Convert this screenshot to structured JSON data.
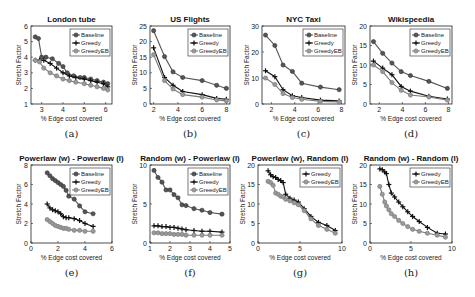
{
  "chart_data": [
    {
      "id": "a",
      "caption": "(a)",
      "type": "line",
      "title": "London tube",
      "xlabel": "% Edge cost covered",
      "ylabel": "Stretch Factor",
      "xlim": [
        2.5,
        6.3
      ],
      "ylim": [
        1,
        6
      ],
      "xticks": [
        3,
        4,
        5,
        6
      ],
      "yticks": [
        1,
        2,
        3,
        4,
        5,
        6
      ],
      "legend_position": "upper right",
      "series": [
        {
          "name": "Baseline",
          "marker": "circle",
          "x": [
            2.7,
            2.85,
            3.0,
            3.2,
            3.5,
            3.8,
            4.0,
            4.2,
            4.5,
            4.8,
            5.0,
            5.3,
            5.6,
            5.9,
            6.1
          ],
          "y": [
            5.3,
            5.2,
            4.0,
            4.0,
            3.9,
            3.6,
            3.4,
            3.0,
            2.8,
            2.7,
            2.7,
            2.6,
            2.5,
            2.4,
            2.3
          ]
        },
        {
          "name": "Greedy",
          "marker": "plus",
          "x": [
            2.7,
            2.9,
            3.1,
            3.4,
            3.7,
            4.0,
            4.3,
            4.6,
            5.0,
            5.3,
            5.6,
            5.9,
            6.1
          ],
          "y": [
            3.8,
            3.8,
            3.8,
            3.6,
            3.3,
            3.0,
            2.8,
            2.7,
            2.6,
            2.5,
            2.4,
            2.3,
            2.1
          ]
        },
        {
          "name": "GreedyEB",
          "marker": "circle-open",
          "x": [
            2.7,
            2.9,
            3.1,
            3.4,
            3.7,
            4.0,
            4.3,
            4.6,
            5.0,
            5.3,
            5.6,
            5.9,
            6.1
          ],
          "y": [
            3.8,
            3.7,
            3.3,
            3.0,
            2.8,
            2.6,
            2.5,
            2.4,
            2.3,
            2.2,
            2.1,
            2.0,
            1.9
          ]
        }
      ]
    },
    {
      "id": "b",
      "caption": "(b)",
      "type": "line",
      "title": "US Flights",
      "xlabel": "% Edge cost covered",
      "ylabel": "Stretch Factor",
      "xlim": [
        1.7,
        8.3
      ],
      "ylim": [
        0,
        25
      ],
      "xticks": [
        2,
        4,
        6,
        8
      ],
      "yticks": [
        0,
        5,
        10,
        15,
        20,
        25
      ],
      "legend_position": "upper right",
      "series": [
        {
          "name": "Baseline",
          "marker": "circle",
          "x": [
            2.0,
            2.9,
            3.6,
            4.4,
            6.0,
            7.2,
            8.0
          ],
          "y": [
            23.5,
            15.2,
            10.3,
            8.5,
            7.5,
            6.0,
            5.0
          ]
        },
        {
          "name": "Greedy",
          "marker": "plus",
          "x": [
            2.0,
            2.9,
            3.6,
            4.4,
            6.0,
            7.2,
            8.0
          ],
          "y": [
            18.0,
            8.5,
            6.0,
            4.0,
            3.0,
            1.8,
            1.5
          ]
        },
        {
          "name": "GreedyEB",
          "marker": "circle-open",
          "x": [
            2.0,
            2.9,
            3.6,
            4.4,
            6.0,
            7.2,
            8.0
          ],
          "y": [
            15.8,
            7.5,
            4.8,
            3.0,
            2.2,
            1.3,
            1.0
          ]
        }
      ]
    },
    {
      "id": "c",
      "caption": "(c)",
      "type": "line",
      "title": "NYC Taxi",
      "xlabel": "% Edge cost covered",
      "ylabel": "Stretch Factor",
      "xlim": [
        1.2,
        8.3
      ],
      "ylim": [
        0,
        30
      ],
      "xticks": [
        2,
        4,
        6,
        8
      ],
      "yticks": [
        0,
        10,
        20,
        30
      ],
      "legend_position": "upper right",
      "series": [
        {
          "name": "Baseline",
          "marker": "circle",
          "x": [
            1.5,
            2.3,
            3.0,
            3.8,
            4.6,
            6.2,
            7.8
          ],
          "y": [
            26.5,
            22.5,
            15.0,
            12.5,
            8.0,
            6.5,
            5.5
          ]
        },
        {
          "name": "Greedy",
          "marker": "plus",
          "x": [
            1.5,
            2.3,
            3.0,
            3.8,
            4.6,
            6.2,
            7.8
          ],
          "y": [
            12.8,
            10.5,
            5.5,
            3.2,
            2.5,
            1.5,
            1.2
          ]
        },
        {
          "name": "GreedyEB",
          "marker": "circle-open",
          "x": [
            1.5,
            2.3,
            3.0,
            3.8,
            4.6,
            6.2,
            7.8
          ],
          "y": [
            10.0,
            7.5,
            4.0,
            2.5,
            1.8,
            1.0,
            0.8
          ]
        }
      ]
    },
    {
      "id": "d",
      "caption": "(d)",
      "type": "line",
      "title": "Wikispeedia",
      "xlabel": "% Edge cost covered",
      "ylabel": "Stretch Factor",
      "xlim": [
        1.2,
        8.3
      ],
      "ylim": [
        0,
        20
      ],
      "xticks": [
        2,
        4,
        6,
        8
      ],
      "yticks": [
        0,
        5,
        10,
        15,
        20
      ],
      "legend_position": "upper right",
      "series": [
        {
          "name": "Baseline",
          "marker": "circle",
          "x": [
            1.5,
            2.3,
            3.1,
            3.9,
            4.7,
            6.3,
            7.9
          ],
          "y": [
            16.0,
            13.0,
            10.5,
            8.3,
            7.3,
            5.8,
            4.0
          ]
        },
        {
          "name": "Greedy",
          "marker": "plus",
          "x": [
            1.5,
            2.3,
            3.1,
            3.9,
            4.7,
            6.3,
            7.9
          ],
          "y": [
            11.0,
            9.2,
            7.5,
            4.5,
            3.3,
            2.0,
            1.3
          ]
        },
        {
          "name": "GreedyEB",
          "marker": "circle-open",
          "x": [
            1.5,
            2.3,
            3.1,
            3.9,
            4.7,
            6.3,
            7.9
          ],
          "y": [
            10.0,
            8.3,
            5.5,
            3.5,
            2.3,
            1.8,
            1.0
          ]
        }
      ]
    },
    {
      "id": "e",
      "caption": "(e)",
      "type": "line",
      "title": "Powerlaw (w) - Powerlaw (l)",
      "xlabel": "% Edge cost covered",
      "ylabel": "Stretch Factor",
      "xlim": [
        0,
        6
      ],
      "ylim": [
        0,
        8
      ],
      "xticks": [
        0,
        2,
        4,
        6
      ],
      "yticks": [
        0,
        2,
        4,
        6,
        8
      ],
      "legend_position": "upper right",
      "series": [
        {
          "name": "Baseline",
          "marker": "circle",
          "x": [
            1.2,
            1.4,
            1.6,
            1.8,
            2.0,
            2.2,
            2.4,
            2.6,
            2.8,
            3.2,
            3.6,
            4.0,
            4.6
          ],
          "y": [
            7.2,
            6.9,
            6.6,
            6.4,
            6.2,
            6.0,
            5.8,
            5.4,
            4.8,
            4.5,
            3.8,
            3.2,
            3.0
          ]
        },
        {
          "name": "Greedy",
          "marker": "plus",
          "x": [
            1.2,
            1.4,
            1.6,
            1.8,
            2.0,
            2.2,
            2.4,
            2.6,
            2.8,
            3.2,
            3.6,
            4.0,
            4.6
          ],
          "y": [
            4.0,
            3.6,
            3.4,
            3.3,
            3.2,
            3.0,
            2.7,
            2.6,
            2.6,
            2.5,
            2.3,
            2.0,
            1.7
          ]
        },
        {
          "name": "GreedyEB",
          "marker": "circle-open",
          "x": [
            1.2,
            1.4,
            1.6,
            1.8,
            2.0,
            2.2,
            2.4,
            2.6,
            2.8,
            3.2,
            3.6,
            4.0,
            4.6
          ],
          "y": [
            2.4,
            2.2,
            2.0,
            1.8,
            1.7,
            1.6,
            1.5,
            1.5,
            1.4,
            1.3,
            1.3,
            1.2,
            1.2
          ]
        }
      ]
    },
    {
      "id": "f",
      "caption": "(f)",
      "type": "line",
      "title": "Random (w) - Powerlaw (l)",
      "xlabel": "% Edge cost covered",
      "ylabel": "Stretch Factor",
      "xlim": [
        1,
        5
      ],
      "ylim": [
        0,
        10
      ],
      "xticks": [
        1,
        2,
        3,
        4,
        5
      ],
      "yticks": [
        0,
        5,
        10
      ],
      "legend_position": "upper right",
      "series": [
        {
          "name": "Baseline",
          "marker": "circle",
          "x": [
            1.2,
            1.4,
            1.6,
            1.8,
            2.0,
            2.2,
            2.4,
            2.6,
            2.8,
            3.2,
            3.6,
            4.0,
            4.6
          ],
          "y": [
            9.3,
            8.4,
            7.8,
            6.8,
            6.8,
            6.2,
            5.8,
            4.9,
            4.8,
            4.4,
            4.2,
            3.9,
            3.7
          ]
        },
        {
          "name": "Greedy",
          "marker": "plus",
          "x": [
            1.2,
            1.4,
            1.6,
            1.8,
            2.0,
            2.2,
            2.4,
            2.6,
            2.8,
            3.2,
            3.6,
            4.0,
            4.6
          ],
          "y": [
            2.2,
            2.2,
            2.1,
            2.1,
            2.0,
            2.0,
            1.9,
            1.8,
            1.7,
            1.6,
            1.5,
            1.5,
            1.4
          ]
        },
        {
          "name": "GreedyEB",
          "marker": "circle-open",
          "x": [
            1.2,
            1.4,
            1.6,
            1.8,
            2.0,
            2.2,
            2.4,
            2.6,
            2.8,
            3.2,
            3.6,
            4.0,
            4.6
          ],
          "y": [
            1.3,
            1.3,
            1.2,
            1.2,
            1.2,
            1.1,
            1.1,
            1.1,
            1.0,
            1.0,
            1.0,
            1.0,
            1.0
          ]
        }
      ]
    },
    {
      "id": "g",
      "caption": "(g)",
      "type": "line",
      "title": "Powerlaw (w), Random (l)",
      "xlabel": "% Edge cost covered",
      "ylabel": "Stretch Factor",
      "xlim": [
        0,
        10
      ],
      "ylim": [
        0,
        20
      ],
      "xticks": [
        0,
        5,
        10
      ],
      "yticks": [
        0,
        5,
        10,
        15,
        20
      ],
      "legend_position": "upper right",
      "series": [
        {
          "name": "Greedy",
          "marker": "plus",
          "x": [
            1.2,
            1.5,
            1.8,
            2.1,
            2.4,
            2.7,
            3.0,
            3.3,
            3.8,
            4.3,
            4.8,
            5.5,
            6.3,
            7.2,
            8.2,
            9.2
          ],
          "y": [
            18.5,
            17.5,
            17.0,
            16.8,
            16.3,
            16.0,
            15.5,
            12.5,
            11.5,
            11.0,
            10.5,
            8.8,
            6.8,
            5.3,
            4.5,
            3.2
          ]
        },
        {
          "name": "GreedyEB",
          "marker": "circle-open",
          "x": [
            1.2,
            1.5,
            1.8,
            2.1,
            2.4,
            2.7,
            3.0,
            3.3,
            3.8,
            4.3,
            4.8,
            5.5,
            6.3,
            7.2,
            8.2,
            9.2
          ],
          "y": [
            15.8,
            15.5,
            14.8,
            12.8,
            12.5,
            12.0,
            11.8,
            11.2,
            10.8,
            10.3,
            9.8,
            8.3,
            6.2,
            4.5,
            3.5,
            2.5
          ]
        }
      ]
    },
    {
      "id": "h",
      "caption": "(h)",
      "type": "line",
      "title": "Random (w) - Random (l)",
      "xlabel": "% Edge cost covered",
      "ylabel": "Stretch Factor",
      "xlim": [
        0,
        10
      ],
      "ylim": [
        0,
        20
      ],
      "xticks": [
        0,
        5,
        10
      ],
      "yticks": [
        0,
        5,
        10,
        15,
        20
      ],
      "legend_position": "upper right",
      "series": [
        {
          "name": "Greedy",
          "marker": "plus",
          "x": [
            1.2,
            1.5,
            1.8,
            2.0,
            2.3,
            2.6,
            3.0,
            3.5,
            4.0,
            4.6,
            5.2,
            6.0,
            7.0,
            8.2,
            9.2
          ],
          "y": [
            19.0,
            18.8,
            18.2,
            17.8,
            15.0,
            12.8,
            11.8,
            10.5,
            9.3,
            8.0,
            6.8,
            5.5,
            4.0,
            2.5,
            2.3
          ]
        },
        {
          "name": "GreedyEB",
          "marker": "circle-open",
          "x": [
            1.2,
            1.5,
            1.8,
            2.0,
            2.3,
            2.6,
            3.0,
            3.5,
            4.0,
            4.6,
            5.2,
            6.0,
            7.0,
            8.2,
            9.2
          ],
          "y": [
            14.5,
            12.5,
            10.5,
            9.5,
            8.5,
            7.5,
            6.8,
            5.8,
            5.0,
            4.2,
            3.5,
            3.0,
            2.5,
            2.0,
            1.5
          ]
        }
      ]
    }
  ],
  "colors": {
    "Baseline": "#555555",
    "Greedy": "#111111",
    "GreedyEB": "#7a7a7a",
    "axis": "#222222"
  }
}
